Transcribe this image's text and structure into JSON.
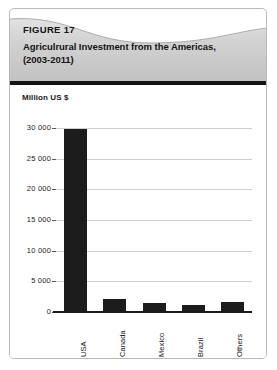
{
  "figure": {
    "label": "FIGURE 17",
    "title_line1": "Agriculrural Investment from the Americas,",
    "title_line2": "(2003-2011)"
  },
  "chart_data": {
    "type": "bar",
    "title": "Agriculrural Investment from the Americas, (2003-2011)",
    "categories": [
      "USA",
      "Canada",
      "Mexico",
      "Brazil",
      "Others"
    ],
    "values": [
      29800,
      2100,
      1550,
      1200,
      1700
    ],
    "xlabel": "",
    "ylabel": "Million US $",
    "ylim": [
      0,
      30000
    ],
    "ytick_labels": [
      "0",
      "5 000",
      "10 000",
      "15 000",
      "20 000",
      "25 000",
      "30 000"
    ],
    "ytick_values": [
      0,
      5000,
      10000,
      15000,
      20000,
      25000,
      30000
    ],
    "grid": true,
    "legend": "none",
    "bar_color": "#1c1c1c"
  },
  "axis": {
    "unit_label": "Million US $"
  }
}
